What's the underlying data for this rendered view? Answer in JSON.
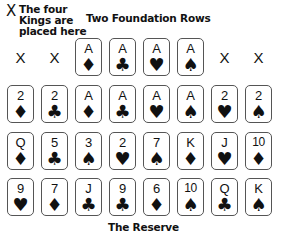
{
  "labels": {
    "kings_marker": "X",
    "kings_note": "The four Kings are placed here",
    "kings_note_lines": [
      "The four",
      "Kings are",
      "placed here"
    ],
    "foundation_title": "Two Foundation Rows",
    "reserve_title": "The Reserve"
  },
  "suit_glyphs": {
    "diamond": "♦",
    "club": "♣",
    "heart": "♥",
    "spade": "♠"
  },
  "rows": [
    {
      "name": "king-row",
      "slots": [
        {
          "type": "placeholder",
          "label": "X"
        },
        {
          "type": "placeholder",
          "label": "X"
        },
        {
          "type": "card",
          "rank": "A",
          "suit": "diamond",
          "glyph": "♦"
        },
        {
          "type": "card",
          "rank": "A",
          "suit": "club",
          "glyph": "♣"
        },
        {
          "type": "card",
          "rank": "A",
          "suit": "heart",
          "glyph": "♥"
        },
        {
          "type": "card",
          "rank": "A",
          "suit": "spade",
          "glyph": "♠"
        },
        {
          "type": "placeholder",
          "label": "X"
        },
        {
          "type": "placeholder",
          "label": "X"
        }
      ]
    },
    {
      "name": "foundation-row",
      "slots": [
        {
          "type": "card",
          "rank": "2",
          "suit": "diamond",
          "glyph": "♦"
        },
        {
          "type": "card",
          "rank": "2",
          "suit": "club",
          "glyph": "♣"
        },
        {
          "type": "card",
          "rank": "A",
          "suit": "diamond",
          "glyph": "♦"
        },
        {
          "type": "card",
          "rank": "A",
          "suit": "club",
          "glyph": "♣"
        },
        {
          "type": "card",
          "rank": "A",
          "suit": "heart",
          "glyph": "♥"
        },
        {
          "type": "card",
          "rank": "A",
          "suit": "spade",
          "glyph": "♠"
        },
        {
          "type": "card",
          "rank": "2",
          "suit": "heart",
          "glyph": "♥"
        },
        {
          "type": "card",
          "rank": "2",
          "suit": "spade",
          "glyph": "♠"
        }
      ]
    },
    {
      "name": "reserve-row-1",
      "slots": [
        {
          "type": "card",
          "rank": "Q",
          "suit": "diamond",
          "glyph": "♦"
        },
        {
          "type": "card",
          "rank": "5",
          "suit": "club",
          "glyph": "♣"
        },
        {
          "type": "card",
          "rank": "3",
          "suit": "spade",
          "glyph": "♠"
        },
        {
          "type": "card",
          "rank": "2",
          "suit": "heart",
          "glyph": "♥"
        },
        {
          "type": "card",
          "rank": "7",
          "suit": "spade",
          "glyph": "♠"
        },
        {
          "type": "card",
          "rank": "K",
          "suit": "diamond",
          "glyph": "♦"
        },
        {
          "type": "card",
          "rank": "J",
          "suit": "heart",
          "glyph": "♥"
        },
        {
          "type": "card",
          "rank": "10",
          "suit": "diamond",
          "glyph": "♦"
        }
      ]
    },
    {
      "name": "reserve-row-2",
      "slots": [
        {
          "type": "card",
          "rank": "9",
          "suit": "heart",
          "glyph": "♥"
        },
        {
          "type": "card",
          "rank": "7",
          "suit": "diamond",
          "glyph": "♦"
        },
        {
          "type": "card",
          "rank": "J",
          "suit": "club",
          "glyph": "♣"
        },
        {
          "type": "card",
          "rank": "9",
          "suit": "club",
          "glyph": "♣"
        },
        {
          "type": "card",
          "rank": "6",
          "suit": "diamond",
          "glyph": "♦"
        },
        {
          "type": "card",
          "rank": "10",
          "suit": "spade",
          "glyph": "♠"
        },
        {
          "type": "card",
          "rank": "Q",
          "suit": "club",
          "glyph": "♣"
        },
        {
          "type": "card",
          "rank": "K",
          "suit": "spade",
          "glyph": "♠"
        }
      ]
    }
  ]
}
